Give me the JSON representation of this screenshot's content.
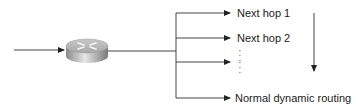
{
  "diagram": {
    "type": "policy-routing-decision-flow",
    "input": {
      "label": ""
    },
    "router": {
      "icon": "router-icon"
    },
    "branches": [
      {
        "label": "Next hop 1",
        "y": 13
      },
      {
        "label": "Next hop 2",
        "y": 38
      },
      {
        "label": "",
        "y": 62
      },
      {
        "label": "Normal dynamic routing",
        "y": 98
      }
    ],
    "ellipsis": "⋮",
    "order_arrow": {
      "direction": "down"
    },
    "colors": {
      "line": "#333333",
      "router_top": "#d9d9d9",
      "router_side": "#9a9a9a"
    }
  }
}
